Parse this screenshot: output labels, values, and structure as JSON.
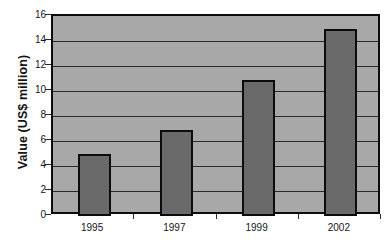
{
  "chart_data": {
    "type": "bar",
    "title": "",
    "subtitle": "",
    "xlabel": "",
    "ylabel": "Value (US$ million)",
    "categories": [
      "1995",
      "1997",
      "1999",
      "2002"
    ],
    "values": [
      5.0,
      6.9,
      10.9,
      15.0
    ],
    "ylim": [
      0,
      16
    ],
    "y_ticks": [
      "0",
      "2",
      "4",
      "6",
      "8",
      "10",
      "12",
      "14",
      "16"
    ],
    "y_tick_values": [
      0,
      2,
      4,
      6,
      8,
      10,
      12,
      14,
      16
    ],
    "grid": "horizontal",
    "legend": "none",
    "annotations": [],
    "colors": {
      "bar_fill": "#6a6a6a",
      "bar_border": "#0c0c0c",
      "plot_background": "#a8a8a8",
      "gridline": "#2a2a2a",
      "axis": "#0c0c0c",
      "text": "#151515",
      "figure_background": "#ffffff"
    }
  }
}
